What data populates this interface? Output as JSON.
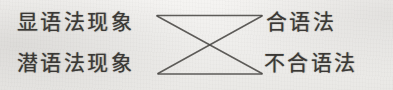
{
  "figure": {
    "kind": "mapping-diagram",
    "background_color": "#f2f1ef",
    "ink_color": "#3a3835",
    "nodes": {
      "left": [
        {
          "id": "explicit-grammar-phenomenon",
          "label": "显语法现象"
        },
        {
          "id": "implicit-grammar-phenomenon",
          "label": "潜语法现象"
        }
      ],
      "right": [
        {
          "id": "grammatical",
          "label": "合语法"
        },
        {
          "id": "ungrammatical",
          "label": "不合语法"
        }
      ]
    },
    "edges": [
      {
        "from": "explicit-grammar-phenomenon",
        "to": "grammatical",
        "shape": "horizontal"
      },
      {
        "from": "explicit-grammar-phenomenon",
        "to": "ungrammatical",
        "shape": "diagonal"
      },
      {
        "from": "implicit-grammar-phenomenon",
        "to": "grammatical",
        "shape": "diagonal"
      },
      {
        "from": "implicit-grammar-phenomenon",
        "to": "ungrammatical",
        "shape": "horizontal"
      }
    ]
  }
}
